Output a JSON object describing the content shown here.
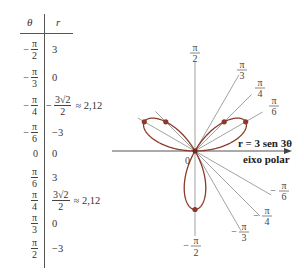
{
  "table": {
    "headers": {
      "theta": "θ",
      "r": "r"
    },
    "rows": [
      {
        "theta": {
          "sign": "−",
          "num": "π",
          "den": "2"
        },
        "r": {
          "text": "3"
        }
      },
      {
        "theta": {
          "sign": "−",
          "num": "π",
          "den": "3"
        },
        "r": {
          "text": "0"
        }
      },
      {
        "theta": {
          "sign": "−",
          "num": "π",
          "den": "4"
        },
        "r": {
          "sign": "−",
          "num": "3√2",
          "den": "2",
          "approx": "≈ 2,12"
        }
      },
      {
        "theta": {
          "sign": "−",
          "num": "π",
          "den": "6"
        },
        "r": {
          "text": "−3"
        }
      },
      {
        "theta": {
          "text": "0"
        },
        "r": {
          "text": "0"
        }
      },
      {
        "theta": {
          "sign": "",
          "num": "π",
          "den": "6"
        },
        "r": {
          "text": "3"
        }
      },
      {
        "theta": {
          "sign": "",
          "num": "π",
          "den": "4"
        },
        "r": {
          "sign": "",
          "num": "3√2",
          "den": "2",
          "approx": "≈ 2,12"
        }
      },
      {
        "theta": {
          "sign": "",
          "num": "π",
          "den": "3"
        },
        "r": {
          "text": "0"
        }
      },
      {
        "theta": {
          "sign": "",
          "num": "π",
          "den": "2"
        },
        "r": {
          "text": "−3"
        }
      }
    ]
  },
  "graph": {
    "equation_label": "r = 3 sen 3θ",
    "axis_label": "eixo polar",
    "origin_label": "0",
    "angle_labels": {
      "pi2": {
        "sign": "",
        "num": "π",
        "den": "2"
      },
      "pi3": {
        "sign": "",
        "num": "π",
        "den": "3"
      },
      "pi4": {
        "sign": "",
        "num": "π",
        "den": "4"
      },
      "pi6": {
        "sign": "",
        "num": "π",
        "den": "6"
      },
      "mpi6": {
        "sign": "−",
        "num": "π",
        "den": "6"
      },
      "mpi4": {
        "sign": "−",
        "num": "π",
        "den": "4"
      },
      "mpi3": {
        "sign": "−",
        "num": "π",
        "den": "3"
      },
      "mpi2": {
        "sign": "−",
        "num": "π",
        "den": "2"
      }
    },
    "colors": {
      "curve": "#8b3a2a",
      "lines": "#777777",
      "dots": "#8b3a2a"
    }
  },
  "chart_data": {
    "type": "polar-line",
    "title": "r = 3 sen 3θ",
    "equation": "r = 3 sin(3θ)",
    "axis_label": "eixo polar",
    "theta_ticks": [
      "−π/2",
      "−π/3",
      "−π/4",
      "−π/6",
      "0",
      "π/6",
      "π/4",
      "π/3",
      "π/2"
    ],
    "table": {
      "theta": [
        "−π/2",
        "−π/3",
        "−π/4",
        "−π/6",
        "0",
        "π/6",
        "π/4",
        "π/3",
        "π/2"
      ],
      "r": [
        3,
        0,
        -2.12,
        -3,
        0,
        3,
        2.12,
        0,
        -3
      ],
      "r_display": [
        "3",
        "0",
        "−3√2/2 ≈ 2,12",
        "−3",
        "0",
        "3",
        "3√2/2 ≈ 2,12",
        "0",
        "−3"
      ]
    },
    "plotted_points_xy": [
      {
        "theta": "π/6",
        "r": 3
      },
      {
        "theta": "π/4",
        "r": 2.12
      },
      {
        "theta": "−π/6",
        "r": -3
      },
      {
        "theta": "−π/4",
        "r": -2.12
      },
      {
        "theta": "−π/2",
        "r": 3
      }
    ],
    "petals": 3,
    "max_r": 3,
    "grid": false
  }
}
